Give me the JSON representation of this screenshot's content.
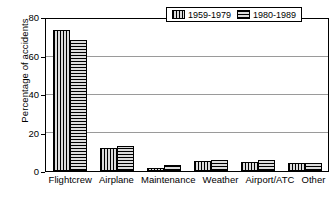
{
  "chart_data": {
    "type": "bar",
    "title": "",
    "xlabel": "",
    "ylabel": "Percentage of accidents",
    "categories": [
      "Flightcrew",
      "Airplane",
      "Maintenance",
      "Weather",
      "Airport/ATC",
      "Other"
    ],
    "series": [
      {
        "name": "1959-1979",
        "pattern": "vertical-hatch",
        "values": [
          74,
          12,
          1.5,
          5.5,
          4.5,
          4
        ]
      },
      {
        "name": "1980-1989",
        "pattern": "horizontal-hatch",
        "values": [
          69,
          13,
          3,
          6,
          6,
          4
        ]
      }
    ],
    "ylim": [
      0,
      80
    ],
    "yticks": [
      0,
      20,
      40,
      60,
      80
    ],
    "ytick_labels": [
      "0",
      "20",
      "40",
      "60",
      "80"
    ],
    "gridlines": [
      20,
      40,
      60
    ],
    "grid": true,
    "legend_position": "top-right",
    "bar_fill_color": "#dcdcdc",
    "bar_edge_color": "#000000",
    "background_color": "#ffffff"
  },
  "legend": {
    "entries": [
      {
        "label": "1959-1979"
      },
      {
        "label": "1980-1989"
      }
    ]
  },
  "axes": {
    "y_title": "Percentage of accidents"
  }
}
